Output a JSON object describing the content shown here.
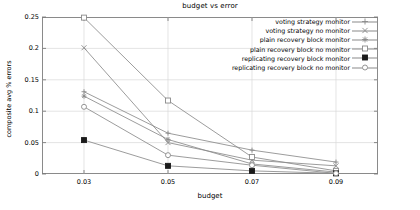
{
  "chart_data": {
    "type": "line",
    "title": "budget vs error",
    "xlabel": "budget",
    "ylabel": "composite avg % errors",
    "x": [
      0.03,
      0.05,
      0.07,
      0.09
    ],
    "xtick_labels": [
      "0.03",
      "0.05",
      "0.07",
      "0.09"
    ],
    "ytick_labels": [
      "0",
      "0.05",
      "0.1",
      "0.15",
      "0.2",
      "0.25"
    ],
    "ytick_values": [
      0,
      0.05,
      0.1,
      0.15,
      0.2,
      0.25
    ],
    "xlim": [
      0.02,
      0.1
    ],
    "ylim": [
      0,
      0.25
    ],
    "grid": true,
    "legend_position": "top-right-inside",
    "line_color": "#8a8a8a",
    "series": [
      {
        "name": "voting strategy monitor",
        "marker": "plus",
        "values": [
          0.131,
          0.065,
          0.038,
          0.019
        ]
      },
      {
        "name": "voting strategy no monitor",
        "marker": "cross",
        "values": [
          0.201,
          0.05,
          0.022,
          0.013
        ]
      },
      {
        "name": "plain recovery block monitor",
        "marker": "asterisk",
        "values": [
          0.124,
          0.055,
          0.016,
          0.003
        ]
      },
      {
        "name": "plain recovery block no monitor",
        "marker": "open-square",
        "values": [
          0.249,
          0.117,
          0.027,
          0.005
        ]
      },
      {
        "name": "replicating recovery block monitor",
        "marker": "filled-square",
        "values": [
          0.054,
          0.013,
          0.005,
          0.001
        ]
      },
      {
        "name": "replicating recovery block no monitor",
        "marker": "open-circle",
        "values": [
          0.107,
          0.03,
          0.014,
          0.001
        ]
      }
    ]
  }
}
